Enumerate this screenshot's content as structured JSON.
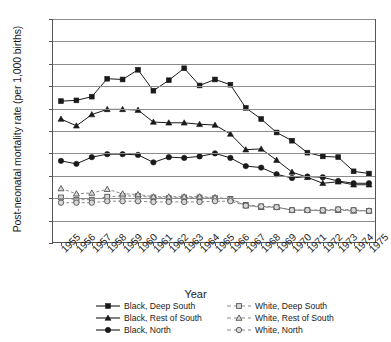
{
  "chart_data": {
    "type": "line",
    "title": "",
    "xlabel": "Year",
    "ylabel": "Post-neonatal mortality rate (per 1,000 births)",
    "x": [
      1955,
      1956,
      1957,
      1958,
      1959,
      1960,
      1961,
      1962,
      1963,
      1964,
      1965,
      1966,
      1967,
      1968,
      1969,
      1970,
      1971,
      1972,
      1973,
      1974,
      1975
    ],
    "xtick_labels": [
      "1955",
      "1956",
      "1957",
      "1958",
      "1959",
      "1960",
      "1961",
      "1962",
      "1963",
      "1964",
      "1965",
      "1966",
      "1967",
      "1968",
      "1969",
      "1970",
      "1971",
      "1972",
      "1973",
      "1974",
      "1975"
    ],
    "ylim": [
      0,
      30
    ],
    "yticks": [
      0,
      3,
      6,
      9,
      12,
      15,
      18,
      21,
      24,
      27,
      30
    ],
    "ytick_labels": [
      "0",
      "3",
      "6",
      "9",
      "12",
      "15",
      "18",
      "21",
      "24",
      "27",
      "30"
    ],
    "grid": true,
    "legend_position": "bottom",
    "series": [
      {
        "name": "Black, Deep South",
        "marker": "filled-square",
        "line": "solid",
        "color": "#1a1a1a",
        "values": [
          19.0,
          19.1,
          19.6,
          22.0,
          21.9,
          23.2,
          20.4,
          21.8,
          23.4,
          21.1,
          21.9,
          21.2,
          18.1,
          16.6,
          14.8,
          13.7,
          12.1,
          11.6,
          11.5,
          9.6,
          9.3
        ]
      },
      {
        "name": "Black, Rest of South",
        "marker": "filled-triangle",
        "line": "solid",
        "color": "#1a1a1a",
        "values": [
          16.6,
          15.7,
          17.2,
          17.9,
          17.9,
          17.8,
          16.2,
          16.1,
          16.1,
          15.9,
          15.8,
          14.6,
          12.5,
          12.6,
          11.1,
          9.5,
          8.8,
          8.0,
          8.2,
          7.8,
          7.8
        ]
      },
      {
        "name": "Black, North",
        "marker": "filled-circle",
        "line": "solid",
        "color": "#1a1a1a",
        "values": [
          11.0,
          10.6,
          11.5,
          11.9,
          11.9,
          11.8,
          10.8,
          11.5,
          11.4,
          11.6,
          12.0,
          11.4,
          10.3,
          10.1,
          9.2,
          8.7,
          8.9,
          8.8,
          8.3,
          8.0,
          8.0
        ]
      },
      {
        "name": "White, Deep South",
        "marker": "open-square",
        "line": "dashed",
        "color": "#7a7a7a",
        "values": [
          6.1,
          5.8,
          5.8,
          6.2,
          6.3,
          6.3,
          6.1,
          6.0,
          6.1,
          6.1,
          6.0,
          5.9,
          5.1,
          4.9,
          4.8,
          4.4,
          4.4,
          4.4,
          4.5,
          4.4,
          4.3
        ]
      },
      {
        "name": "White, Rest of South",
        "marker": "open-triangle",
        "line": "dashed",
        "color": "#7a7a7a",
        "values": [
          7.3,
          6.6,
          6.7,
          7.2,
          6.6,
          6.5,
          6.2,
          6.2,
          6.2,
          6.2,
          6.1,
          5.9,
          5.0,
          4.8,
          4.8,
          4.4,
          4.4,
          4.3,
          4.4,
          4.3,
          4.3
        ]
      },
      {
        "name": "White, North",
        "marker": "open-circle",
        "line": "dashed",
        "color": "#7a7a7a",
        "values": [
          5.4,
          5.4,
          5.4,
          5.6,
          5.6,
          5.6,
          5.5,
          5.5,
          5.5,
          5.5,
          5.6,
          5.6,
          5.0,
          4.9,
          4.8,
          4.4,
          4.4,
          4.4,
          4.5,
          4.4,
          4.3
        ]
      }
    ]
  },
  "legend": {
    "items": [
      {
        "label": "Black, Deep South",
        "marker": "filled-square",
        "line": "solid"
      },
      {
        "label": "White, Deep South",
        "marker": "open-square",
        "line": "dashed"
      },
      {
        "label": "Black, Rest of South",
        "marker": "filled-triangle",
        "line": "solid"
      },
      {
        "label": "White, Rest of South",
        "marker": "open-triangle",
        "line": "dashed"
      },
      {
        "label": "Black, North",
        "marker": "filled-circle",
        "line": "solid"
      },
      {
        "label": "White, North",
        "marker": "open-circle",
        "line": "dashed"
      }
    ]
  },
  "colors": {
    "black_series": "#1a1a1a",
    "white_series": "#7a7a7a",
    "grid": "#8c8c8c",
    "axis": "#555555",
    "background": "#ffffff"
  }
}
